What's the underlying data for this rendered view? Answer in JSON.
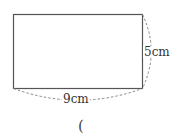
{
  "diagram": {
    "shape": "rectangle",
    "height_label": "5cm",
    "width_label": "9cm",
    "answer_paren": "("
  },
  "colors": {
    "line": "#555555",
    "dashed": "#888888",
    "text": "#333333"
  }
}
